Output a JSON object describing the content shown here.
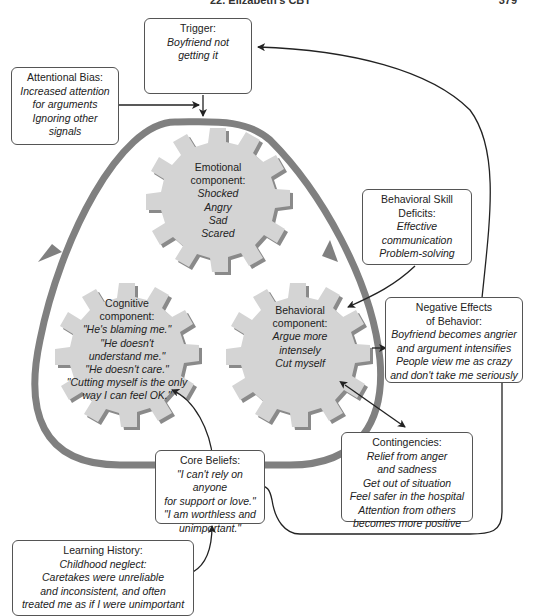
{
  "header": {
    "title": "22. Elizabeth's CBT",
    "page": "379"
  },
  "boxes": {
    "trigger": {
      "title": "Trigger:",
      "lines": [
        "Boyfriend not",
        "getting it"
      ]
    },
    "attentional_bias": {
      "title": "Attentional Bias:",
      "lines": [
        "Increased attention",
        "for arguments",
        "Ignoring other",
        "signals"
      ]
    },
    "skill_deficits": {
      "title_lines": [
        "Behavioral Skill",
        "Deficits:"
      ],
      "lines": [
        "Effective",
        "communication",
        "Problem-solving"
      ]
    },
    "negative_effects": {
      "title_lines": [
        "Negative Effects",
        "of Behavior:"
      ],
      "lines": [
        "Boyfriend becomes angrier",
        "and argument intensifies",
        "People view me as crazy",
        "and don't take me seriously"
      ]
    },
    "contingencies": {
      "title": "Contingencies:",
      "lines": [
        "Relief from anger",
        "and sadness",
        "Get out of situation",
        "Feel safer in the hospital",
        "Attention from others",
        "becomes more positive"
      ]
    },
    "core_beliefs": {
      "title": "Core Beliefs:",
      "lines": [
        "\"I can't rely on anyone",
        "for support or love.\"",
        "\"I am worthless and",
        "unimportant.\""
      ]
    },
    "learning_history": {
      "title": "Learning History:",
      "lines": [
        "Childhood neglect:",
        "Caretakes were unreliable",
        "and inconsistent, and often",
        "treated me as if I were unimportant"
      ]
    }
  },
  "gears": {
    "emotional": {
      "title_lines": [
        "Emotional",
        "component:"
      ],
      "lines": [
        "Shocked",
        "Angry",
        "Sad",
        "Scared"
      ]
    },
    "cognitive": {
      "title_lines": [
        "Cognitive",
        "component:"
      ],
      "lines": [
        "\"He's blaming me.\"",
        "\"He doesn't",
        "understand me.\"",
        "\"He doesn't care.\"",
        "\"Cutting myself is the only",
        "way I can feel OK.\""
      ]
    },
    "behavioral": {
      "title_lines": [
        "Behavioral",
        "component:"
      ],
      "lines": [
        "Argue more",
        "intensely",
        "Cut myself"
      ]
    }
  },
  "colors": {
    "gear_fill": "#d4d4d4",
    "gear_shadow": "#8a8a8a",
    "loop": "#808080",
    "line": "#222222",
    "box_border": "#555555"
  }
}
